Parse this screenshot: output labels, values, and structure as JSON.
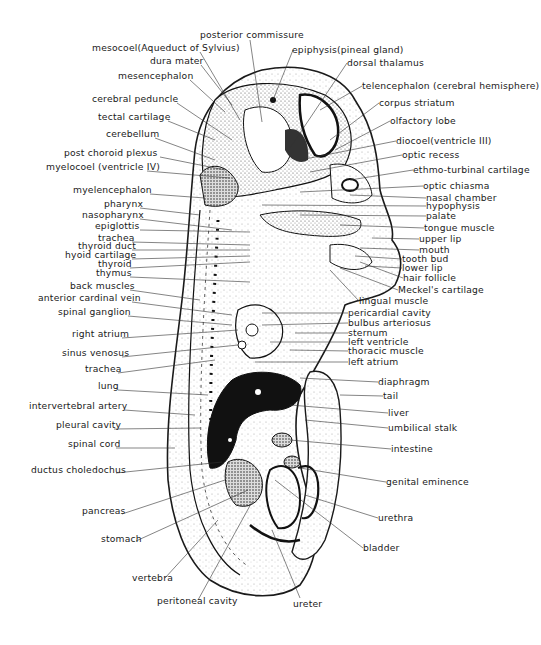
{
  "figure": {
    "labels_left": [
      {
        "id": "mesocoel",
        "text": "mesocoel(Aqueduct of Sylvius)",
        "x": 92,
        "y": 48
      },
      {
        "id": "dura-mater",
        "text": "dura mater",
        "x": 150,
        "y": 61
      },
      {
        "id": "mesencephalon",
        "text": "mesencephalon",
        "x": 118,
        "y": 76
      },
      {
        "id": "cerebral-peduncle",
        "text": "cerebral peduncle",
        "x": 92,
        "y": 99
      },
      {
        "id": "tectal-cartilage",
        "text": "tectal cartilage",
        "x": 98,
        "y": 117
      },
      {
        "id": "cerebellum",
        "text": "cerebellum",
        "x": 106,
        "y": 134
      },
      {
        "id": "post-choroid-plexus",
        "text": "post choroid plexus",
        "x": 64,
        "y": 153
      },
      {
        "id": "myelocoel",
        "text": "myelocoel (ventricle IV)",
        "x": 46,
        "y": 167
      },
      {
        "id": "myelencephalon",
        "text": "myelencephalon",
        "x": 73,
        "y": 190
      },
      {
        "id": "pharynx",
        "text": "pharynx",
        "x": 104,
        "y": 204
      },
      {
        "id": "nasopharynx",
        "text": "nasopharynx",
        "x": 82,
        "y": 215
      },
      {
        "id": "epiglottis",
        "text": "epiglottis",
        "x": 95,
        "y": 226
      },
      {
        "id": "trachea-upper",
        "text": "trachea",
        "x": 98,
        "y": 238
      },
      {
        "id": "thyroid-duct",
        "text": "thyroid duct",
        "x": 78,
        "y": 246
      },
      {
        "id": "hyoid-cartilage",
        "text": "hyoid cartilage",
        "x": 65,
        "y": 255
      },
      {
        "id": "thyroid",
        "text": "thyroid",
        "x": 98,
        "y": 264
      },
      {
        "id": "thymus",
        "text": "thymus",
        "x": 96,
        "y": 273
      },
      {
        "id": "back-muscles",
        "text": "back muscles",
        "x": 70,
        "y": 286
      },
      {
        "id": "anterior-cardinal-vein",
        "text": "anterior cardinal vein",
        "x": 38,
        "y": 298
      },
      {
        "id": "spinal-ganglion",
        "text": "spinal ganglion",
        "x": 58,
        "y": 312
      },
      {
        "id": "right-atrium",
        "text": "right atrium",
        "x": 72,
        "y": 334
      },
      {
        "id": "sinus-venosus",
        "text": "sinus venosus",
        "x": 62,
        "y": 353
      },
      {
        "id": "trachea-lower",
        "text": "trachea",
        "x": 85,
        "y": 369
      },
      {
        "id": "lung",
        "text": "lung",
        "x": 98,
        "y": 386
      },
      {
        "id": "intervertebral-artery",
        "text": "intervertebral artery",
        "x": 29,
        "y": 406
      },
      {
        "id": "pleural-cavity",
        "text": "pleural cavity",
        "x": 56,
        "y": 425
      },
      {
        "id": "spinal-cord",
        "text": "spinal cord",
        "x": 68,
        "y": 444
      },
      {
        "id": "ductus-choledochus",
        "text": "ductus choledochus",
        "x": 31,
        "y": 470
      },
      {
        "id": "pancreas",
        "text": "pancreas",
        "x": 82,
        "y": 511
      },
      {
        "id": "stomach",
        "text": "stomach",
        "x": 101,
        "y": 539
      },
      {
        "id": "vertebra",
        "text": "vertebra",
        "x": 132,
        "y": 578
      },
      {
        "id": "peritoneal-cavity",
        "text": "peritoneal cavity",
        "x": 157,
        "y": 601
      }
    ],
    "labels_right": [
      {
        "id": "posterior-commissure",
        "text": "posterior commissure",
        "x": 200,
        "y": 32
      },
      {
        "id": "epiphysis",
        "text": "epiphysis(pineal gland)",
        "x": 292,
        "y": 47
      },
      {
        "id": "dorsal-thalamus",
        "text": "dorsal thalamus",
        "x": 347,
        "y": 60
      },
      {
        "id": "telencephalon",
        "text": "telencephalon (cerebral hemisphere)",
        "x": 362,
        "y": 83
      },
      {
        "id": "corpus-striatum",
        "text": "corpus striatum",
        "x": 379,
        "y": 100
      },
      {
        "id": "olfactory-lobe",
        "text": "olfactory lobe",
        "x": 390,
        "y": 118
      },
      {
        "id": "diocoel",
        "text": "diocoel(ventricle III)",
        "x": 396,
        "y": 138
      },
      {
        "id": "optic-recess",
        "text": "optic recess",
        "x": 402,
        "y": 152
      },
      {
        "id": "ethmo-turbinal-cartilage",
        "text": "ethmo-turbinal cartilage",
        "x": 413,
        "y": 167
      },
      {
        "id": "optic-chiasma",
        "text": "optic chiasma",
        "x": 423,
        "y": 183
      },
      {
        "id": "nasal-chamber",
        "text": "nasal chamber",
        "x": 426,
        "y": 195
      },
      {
        "id": "hypophysis",
        "text": "hypophysis",
        "x": 426,
        "y": 203
      },
      {
        "id": "palate",
        "text": "palate",
        "x": 426,
        "y": 213
      },
      {
        "id": "tongue-muscle",
        "text": "tongue muscle",
        "x": 424,
        "y": 225
      },
      {
        "id": "upper-lip",
        "text": "upper lip",
        "x": 419,
        "y": 236
      },
      {
        "id": "mouth",
        "text": "mouth",
        "x": 419,
        "y": 247
      },
      {
        "id": "tooth-bud",
        "text": "tooth bud",
        "x": 402,
        "y": 256
      },
      {
        "id": "lower-lip",
        "text": "lower lip",
        "x": 402,
        "y": 265
      },
      {
        "id": "hair-follicle",
        "text": "hair follicle",
        "x": 403,
        "y": 275
      },
      {
        "id": "meckels-cartilage",
        "text": "Meckel's cartilage",
        "x": 398,
        "y": 287
      },
      {
        "id": "lingual-muscle",
        "text": "lingual muscle",
        "x": 359,
        "y": 298
      },
      {
        "id": "pericardial-cavity",
        "text": "pericardial cavity",
        "x": 348,
        "y": 310
      },
      {
        "id": "bulbus-arteriosus",
        "text": "bulbus arteriosus",
        "x": 348,
        "y": 320
      },
      {
        "id": "sternum",
        "text": "sternum",
        "x": 348,
        "y": 330
      },
      {
        "id": "left-ventricle",
        "text": "left ventricle",
        "x": 348,
        "y": 339
      },
      {
        "id": "thoracic-muscle",
        "text": "thoracic muscle",
        "x": 348,
        "y": 348
      },
      {
        "id": "left-atrium",
        "text": "left atrium",
        "x": 348,
        "y": 359
      },
      {
        "id": "diaphragm",
        "text": "diaphragm",
        "x": 378,
        "y": 379
      },
      {
        "id": "tail",
        "text": "tail",
        "x": 383,
        "y": 393
      },
      {
        "id": "liver",
        "text": "liver",
        "x": 388,
        "y": 410
      },
      {
        "id": "umbilical-stalk",
        "text": "umbilical stalk",
        "x": 388,
        "y": 425
      },
      {
        "id": "intestine",
        "text": "intestine",
        "x": 391,
        "y": 446
      },
      {
        "id": "genital-eminence",
        "text": "genital eminence",
        "x": 386,
        "y": 479
      },
      {
        "id": "urethra",
        "text": "urethra",
        "x": 378,
        "y": 515
      },
      {
        "id": "bladder",
        "text": "bladder",
        "x": 363,
        "y": 545
      },
      {
        "id": "ureter",
        "text": "ureter",
        "x": 293,
        "y": 601
      }
    ],
    "colors": {
      "ink": "#1a1a1a",
      "background": "#ffffff",
      "tissue_dark": "#111111",
      "tissue_stipple": "#9a9a9a"
    }
  }
}
